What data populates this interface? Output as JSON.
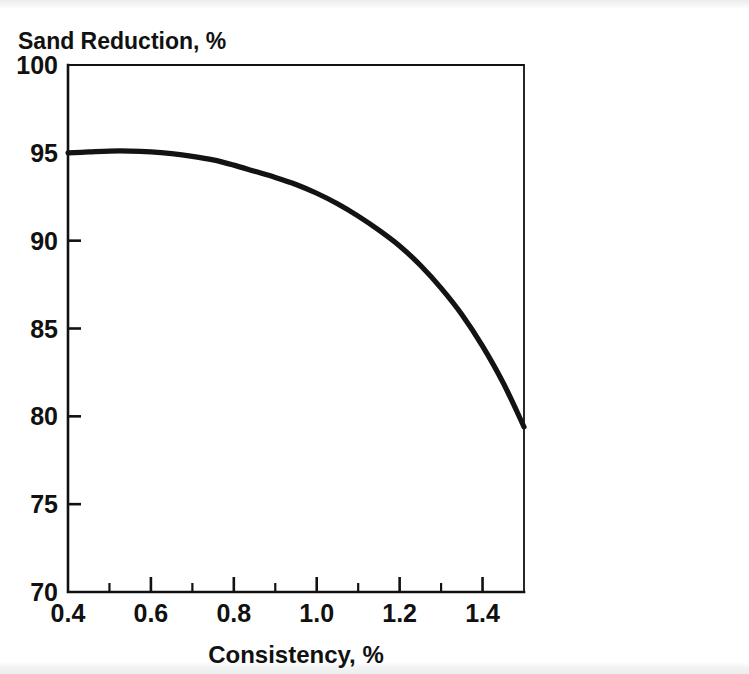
{
  "figure": {
    "background_color": "#ffffff",
    "ink_color": "#111111",
    "curve_color": "#131313"
  },
  "chart_data": {
    "type": "line",
    "title": "",
    "ylabel": "Sand Reduction, %",
    "xlabel": "Consistency, %",
    "xlim": [
      0.4,
      1.5
    ],
    "ylim": [
      70,
      100
    ],
    "grid": false,
    "legend": null,
    "x_major_ticks": [
      0.4,
      0.6,
      0.8,
      1.0,
      1.2,
      1.4
    ],
    "x_major_tick_labels": [
      "0.4",
      "0.6",
      "0.8",
      "1.0",
      "1.2",
      "1.4"
    ],
    "x_minor_ticks": [
      0.5,
      0.7,
      0.9,
      1.1,
      1.3,
      1.5
    ],
    "y_major_ticks": [
      70,
      75,
      80,
      85,
      90,
      95,
      100
    ],
    "y_major_tick_labels": [
      "70",
      "75",
      "80",
      "85",
      "90",
      "95",
      "100"
    ],
    "series": [
      {
        "name": "Sand Reduction",
        "x": [
          0.4,
          0.45,
          0.5,
          0.55,
          0.6,
          0.65,
          0.7,
          0.75,
          0.8,
          0.85,
          0.9,
          0.95,
          1.0,
          1.05,
          1.1,
          1.15,
          1.2,
          1.25,
          1.3,
          1.35,
          1.4,
          1.45,
          1.5
        ],
        "y": [
          95.0,
          95.05,
          95.1,
          95.1,
          95.05,
          94.95,
          94.8,
          94.6,
          94.3,
          93.95,
          93.6,
          93.2,
          92.7,
          92.1,
          91.4,
          90.6,
          89.7,
          88.6,
          87.3,
          85.8,
          84.0,
          81.9,
          79.4
        ]
      }
    ]
  }
}
